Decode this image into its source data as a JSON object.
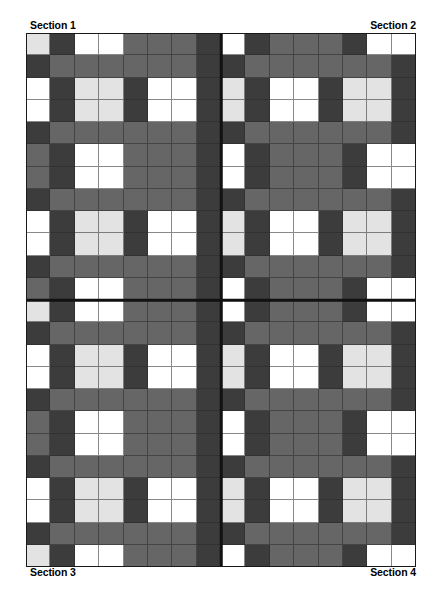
{
  "page": {
    "background_color": "#ffffff",
    "width": 442,
    "height": 595
  },
  "labels": {
    "top_left": "Section 1",
    "top_right": "Section 2",
    "bottom_left": "Section 3",
    "bottom_right": "Section 4"
  },
  "pattern": {
    "title": "Plaid Grid Pattern",
    "columns": 16,
    "rows": 24,
    "divider_column_after": 8,
    "divider_row_after": 12,
    "palette": {
      "light": "#e3e3e3",
      "white": "#ffffff",
      "mid": "#666666",
      "dark": "#3c3c3c",
      "gridline": "#282828",
      "divider": "#111111"
    },
    "legend": {
      "L": "light",
      "W": "white",
      "M": "mid",
      "D": "dark"
    },
    "row_codes": [
      "LDWWMMMD WDMMMDWW",
      "DMMMMMMD DMMMMMMD",
      "WDLLDWWD LDWWDLLD",
      "WDLLDWWD LDWWDLLD",
      "DMMMMMMD DMMMMMMD",
      "MDWWMMMD WDMMMDWW",
      "MDWWMMMD WDMMMDWW",
      "DMMMMMMD DMMMMMMD",
      "WDLLDWWD LDWWDLLD",
      "WDLLDWWD LDWWDLLD",
      "DMMMMMMD DMMMMMMD",
      "MDWWMMMD WDMMMDWW",
      "LDWWMMMD WDMMMDWW",
      "DMMMMMMD DMMMMMMD",
      "WDLLDWWD LDWWDLLD",
      "WDLLDWWD LDWWDLLD",
      "DMMMMMMD DMMMMMMD",
      "MDWWMMMD WDMMMDWW",
      "MDWWMMMD WDMMMDWW",
      "DMMMMMMD DMMMMMMD",
      "WDLLDWWD LDWWDLLD",
      "WDLLDWWD LDWWDLLD",
      "DMMMMMMD DMMMMMMD",
      "LDWWMMMD WDMMMDWW"
    ]
  }
}
